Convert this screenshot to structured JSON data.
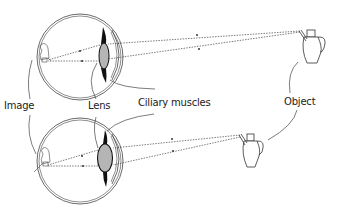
{
  "diagram": {
    "labels": {
      "image": "Image",
      "lens": "Lens",
      "ciliary_muscles": "Ciliary muscles",
      "object": "Object"
    },
    "panels": [
      {
        "name": "distant-object",
        "lens_shape": "thin",
        "object_position": "far"
      },
      {
        "name": "near-object",
        "lens_shape": "thick",
        "object_position": "near"
      }
    ],
    "colors": {
      "line": "#333333",
      "lens_fill": "#b5b5b5",
      "ciliary": "#111111",
      "background": "#ffffff"
    }
  }
}
